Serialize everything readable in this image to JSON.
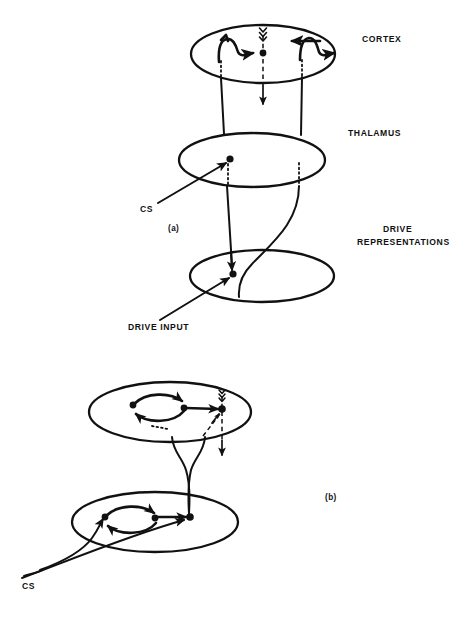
{
  "figure": {
    "background_color": "#ffffff",
    "ink_color": "#111111",
    "width": 457,
    "height": 624
  },
  "panels": [
    {
      "id": "a",
      "marker": "(a)",
      "marker_position": {
        "x": 168,
        "y": 231
      },
      "levels": [
        {
          "name": "cortex",
          "label": "CORTEX",
          "label_position": {
            "x": 362,
            "y": 42
          },
          "ellipse": {
            "cx": 263,
            "cy": 54,
            "rx": 72,
            "ry": 29
          }
        },
        {
          "name": "thalamus",
          "label": "THALAMUS",
          "label_position": {
            "x": 348,
            "y": 136
          },
          "ellipse": {
            "cx": 252,
            "cy": 160,
            "rx": 73,
            "ry": 27
          }
        },
        {
          "name": "drive_representations",
          "label_line_1": "DRIVE",
          "label_line_2": "REPRESENTATIONS",
          "label_position": {
            "x": 383,
            "y": 232
          },
          "ellipse": {
            "cx": 262,
            "cy": 276,
            "rx": 72,
            "ry": 26
          }
        }
      ],
      "inputs": [
        {
          "name": "cs-input",
          "label": "CS",
          "label_position": {
            "x": 140,
            "y": 212
          },
          "target": {
            "x": 230,
            "y": 159
          }
        },
        {
          "name": "drive-input",
          "label": "DRIVE INPUT",
          "label_position": {
            "x": 128,
            "y": 330
          },
          "target": {
            "x": 233,
            "y": 274
          }
        }
      ],
      "nodes": [
        {
          "name": "cortex-center-node",
          "x": 263,
          "y": 53
        },
        {
          "name": "thalamus-node",
          "x": 230,
          "y": 159
        },
        {
          "name": "drive-node",
          "x": 233,
          "y": 274
        }
      ]
    },
    {
      "id": "b",
      "marker": "(b)",
      "marker_position": {
        "x": 325,
        "y": 500
      },
      "levels": [
        {
          "name": "cortex-b",
          "ellipse": {
            "cx": 170,
            "cy": 412,
            "rx": 81,
            "ry": 30
          }
        },
        {
          "name": "drive-b",
          "ellipse": {
            "cx": 155,
            "cy": 522,
            "rx": 83,
            "ry": 30
          }
        }
      ],
      "inputs": [
        {
          "name": "cs-input-b",
          "label": "CS",
          "label_position": {
            "x": 22,
            "y": 589
          }
        }
      ],
      "nodes": [
        {
          "name": "cortex-b-left-node",
          "x": 133,
          "y": 405
        },
        {
          "name": "cortex-b-mid-node",
          "x": 184,
          "y": 408
        },
        {
          "name": "cortex-b-right-node",
          "x": 222,
          "y": 409
        },
        {
          "name": "drive-b-left-node",
          "x": 105,
          "y": 517
        },
        {
          "name": "drive-b-mid-node",
          "x": 155,
          "y": 518
        },
        {
          "name": "drive-b-right-node",
          "x": 190,
          "y": 517
        }
      ]
    }
  ],
  "labels": {
    "cortex": "CORTEX",
    "thalamus": "THALAMUS",
    "drive_line1": "DRIVE",
    "drive_line2": "REPRESENTATIONS",
    "drive_input": "DRIVE INPUT",
    "cs_a": "CS",
    "cs_b": "CS",
    "panel_a": "(a)",
    "panel_b": "(b)"
  }
}
